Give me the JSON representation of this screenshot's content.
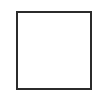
{
  "shape": {
    "type": "square-outline",
    "checked": false,
    "border_color": "#2b2b2b",
    "fill_color": "#ffffff"
  }
}
